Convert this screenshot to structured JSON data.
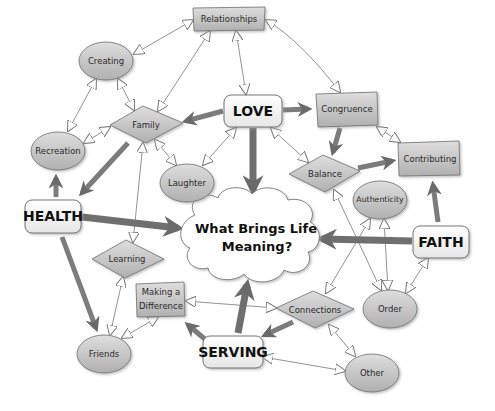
{
  "diagram": {
    "center": {
      "id": "center",
      "line1": "What Brings Life",
      "line2": "Meaning?",
      "shape": "cloud"
    },
    "pillars": [
      {
        "id": "love",
        "label": "LOVE"
      },
      {
        "id": "health",
        "label": "HEALTH"
      },
      {
        "id": "faith",
        "label": "FAITH"
      },
      {
        "id": "serving",
        "label": "SERVING"
      }
    ],
    "nodes": [
      {
        "id": "relationships",
        "label": "Relationships",
        "shape": "rectangle"
      },
      {
        "id": "creating",
        "label": "Creating",
        "shape": "ellipse"
      },
      {
        "id": "congruence",
        "label": "Congruence",
        "shape": "rectangle"
      },
      {
        "id": "family",
        "label": "Family",
        "shape": "diamond"
      },
      {
        "id": "recreation",
        "label": "Recreation",
        "shape": "ellipse"
      },
      {
        "id": "contributing",
        "label": "Contributing",
        "shape": "rectangle"
      },
      {
        "id": "laughter",
        "label": "Laughter",
        "shape": "ellipse"
      },
      {
        "id": "balance",
        "label": "Balance",
        "shape": "diamond"
      },
      {
        "id": "authenticity",
        "label": "Authenticity",
        "shape": "ellipse"
      },
      {
        "id": "learning",
        "label": "Learning",
        "shape": "diamond"
      },
      {
        "id": "making_difference",
        "label_line1": "Making a",
        "label_line2": "Difference",
        "shape": "rectangle"
      },
      {
        "id": "connections",
        "label": "Connections",
        "shape": "diamond"
      },
      {
        "id": "order",
        "label": "Order",
        "shape": "ellipse"
      },
      {
        "id": "friends",
        "label": "Friends",
        "shape": "ellipse"
      },
      {
        "id": "other",
        "label": "Other",
        "shape": "ellipse"
      }
    ],
    "strong_arrows": [
      [
        "LOVE",
        "What Brings Life Meaning?"
      ],
      [
        "HEALTH",
        "What Brings Life Meaning?"
      ],
      [
        "FAITH",
        "What Brings Life Meaning?"
      ],
      [
        "SERVING",
        "What Brings Life Meaning?"
      ],
      [
        "LOVE",
        "Family"
      ],
      [
        "LOVE",
        "Congruence"
      ],
      [
        "Congruence",
        "Balance"
      ],
      [
        "Balance",
        "Contributing"
      ],
      [
        "FAITH",
        "Contributing"
      ],
      [
        "Family",
        "HEALTH"
      ],
      [
        "HEALTH",
        "Recreation"
      ],
      [
        "HEALTH",
        "Friends"
      ],
      [
        "SERVING",
        "Making a Difference"
      ],
      [
        "Connections",
        "SERVING"
      ]
    ],
    "bidirectional_links": [
      [
        "Relationships",
        "Creating"
      ],
      [
        "Relationships",
        "Family"
      ],
      [
        "Relationships",
        "LOVE"
      ],
      [
        "Relationships",
        "Congruence"
      ],
      [
        "Creating",
        "Family"
      ],
      [
        "Creating",
        "Recreation"
      ],
      [
        "Family",
        "Recreation"
      ],
      [
        "Family",
        "Laughter"
      ],
      [
        "Family",
        "Learning"
      ],
      [
        "LOVE",
        "Laughter"
      ],
      [
        "LOVE",
        "Balance"
      ],
      [
        "Congruence",
        "Contributing"
      ],
      [
        "Balance",
        "Order"
      ],
      [
        "Authenticity",
        "Connections"
      ],
      [
        "Authenticity",
        "Order"
      ],
      [
        "FAITH",
        "Order"
      ],
      [
        "Learning",
        "Friends"
      ],
      [
        "Friends",
        "Making a Difference"
      ],
      [
        "Making a Difference",
        "Connections"
      ],
      [
        "Connections",
        "Other"
      ],
      [
        "SERVING",
        "Other"
      ]
    ]
  },
  "colors": {
    "node_fill": "#c8c8c8",
    "node_stroke": "#6e6e6e",
    "pillar_fill": "#ffffff",
    "arrow_strong": "#7a7a7a",
    "cloud_shadow": "#cfcfcf",
    "background": "#ffffff"
  }
}
